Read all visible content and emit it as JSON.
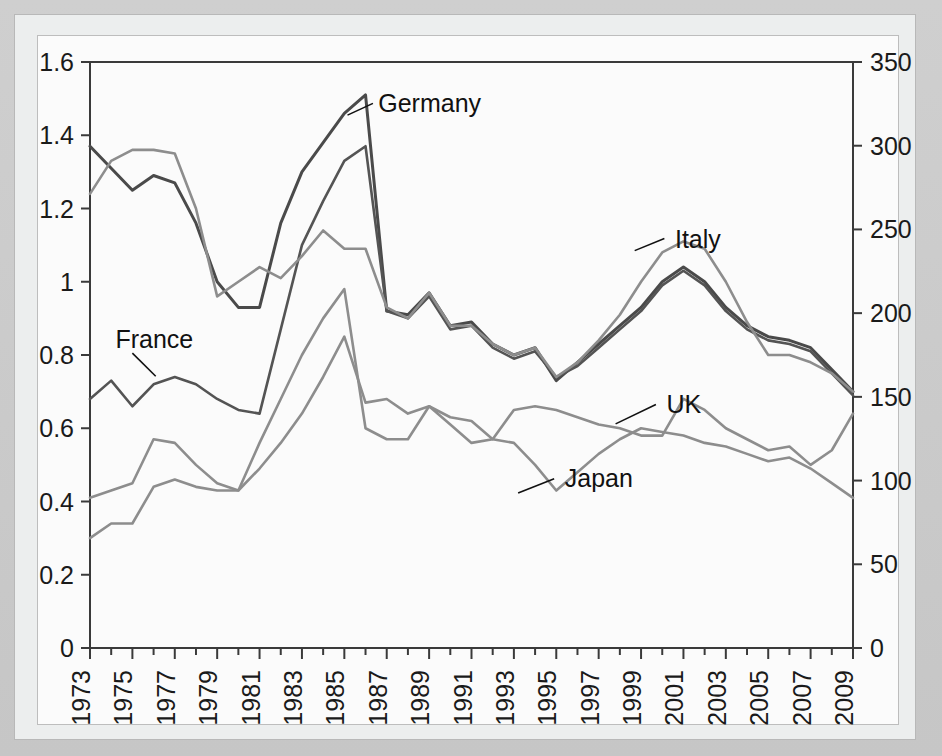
{
  "chart_data": {
    "type": "line",
    "title": "",
    "subtitle": "",
    "xlabel": "",
    "ylabel": "",
    "y2label": "",
    "grid": false,
    "legend_position": "inline-annotations",
    "xlim": [
      1973,
      2009
    ],
    "ylim": [
      0,
      1.6
    ],
    "y2lim": [
      0,
      350
    ],
    "y_ticks": [
      "0",
      "0.2",
      "0.4",
      "0.6",
      "0.8",
      "1",
      "1.2",
      "1.4",
      "1.6"
    ],
    "y_tick_values": [
      0,
      0.2,
      0.4,
      0.6,
      0.8,
      1,
      1.2,
      1.4,
      1.6
    ],
    "y2_ticks": [
      "0",
      "50",
      "100",
      "150",
      "200",
      "250",
      "300",
      "350"
    ],
    "y2_tick_values": [
      0,
      50,
      100,
      150,
      200,
      250,
      300,
      350
    ],
    "x": [
      1973,
      1974,
      1975,
      1976,
      1977,
      1978,
      1979,
      1980,
      1981,
      1982,
      1983,
      1984,
      1985,
      1986,
      1987,
      1988,
      1989,
      1990,
      1991,
      1992,
      1993,
      1994,
      1995,
      1996,
      1997,
      1998,
      1999,
      2000,
      2001,
      2002,
      2003,
      2004,
      2005,
      2006,
      2007,
      2008,
      2009
    ],
    "x_tick_labels": [
      "1973",
      "1975",
      "1977",
      "1979",
      "1981",
      "1983",
      "1985",
      "1987",
      "1989",
      "1991",
      "1993",
      "1995",
      "1997",
      "1999",
      "2001",
      "2003",
      "2005",
      "2007",
      "2009"
    ],
    "x_tick_values": [
      1973,
      1975,
      1977,
      1979,
      1981,
      1983,
      1985,
      1987,
      1989,
      1991,
      1993,
      1995,
      1997,
      1999,
      2001,
      2003,
      2005,
      2007,
      2009
    ],
    "series": [
      {
        "name": "Germany",
        "color": "#4a4a4a",
        "width": 3.0,
        "label_x": 1986.6,
        "label_y": 1.487,
        "leader": [
          [
            1985.15,
            1.455
          ],
          [
            1986.35,
            1.487
          ]
        ],
        "values": [
          1.37,
          1.31,
          1.25,
          1.29,
          1.27,
          1.16,
          1.0,
          0.93,
          0.93,
          1.16,
          1.3,
          1.38,
          1.46,
          1.51,
          0.92,
          0.91,
          0.97,
          0.88,
          0.89,
          0.83,
          0.8,
          0.82,
          0.73,
          0.78,
          0.83,
          0.88,
          0.93,
          1.0,
          1.04,
          1.0,
          0.93,
          0.88,
          0.85,
          0.84,
          0.82,
          0.76,
          0.7
        ]
      },
      {
        "name": "France",
        "color": "#545454",
        "width": 2.6,
        "label_x": 1974.2,
        "label_y": 0.845,
        "leader": [
          [
            1976.1,
            0.742
          ],
          [
            1975.0,
            0.805
          ]
        ],
        "values": [
          0.68,
          0.73,
          0.66,
          0.72,
          0.74,
          0.72,
          0.68,
          0.65,
          0.64,
          0.87,
          1.1,
          1.22,
          1.33,
          1.37,
          0.92,
          0.9,
          0.96,
          0.87,
          0.88,
          0.82,
          0.79,
          0.81,
          0.74,
          0.77,
          0.82,
          0.87,
          0.92,
          0.99,
          1.03,
          0.99,
          0.92,
          0.87,
          0.84,
          0.83,
          0.81,
          0.75,
          0.69
        ]
      },
      {
        "name": "Italy",
        "color": "#8d8d8d",
        "width": 2.6,
        "label_x": 2000.6,
        "label_y": 1.118,
        "leader": [
          [
            1998.7,
            1.085
          ],
          [
            2000.1,
            1.118
          ]
        ],
        "values": [
          1.24,
          1.33,
          1.36,
          1.36,
          1.35,
          1.2,
          0.96,
          1.0,
          1.04,
          1.01,
          1.07,
          1.14,
          1.09,
          1.09,
          0.93,
          0.9,
          0.97,
          0.88,
          0.88,
          0.83,
          0.8,
          0.82,
          0.74,
          0.78,
          0.84,
          0.91,
          1.0,
          1.08,
          1.11,
          1.09,
          1.0,
          0.89,
          0.8,
          0.8,
          0.78,
          0.75,
          0.7
        ]
      },
      {
        "name": "UK",
        "color": "#8d8d8d",
        "width": 2.6,
        "label_x": 2000.2,
        "label_y": 0.665,
        "leader": [
          [
            1997.8,
            0.612
          ],
          [
            1999.7,
            0.665
          ]
        ],
        "values": [
          0.41,
          0.43,
          0.45,
          0.57,
          0.56,
          0.5,
          0.45,
          0.43,
          0.49,
          0.56,
          0.64,
          0.74,
          0.85,
          0.67,
          0.68,
          0.64,
          0.66,
          0.61,
          0.56,
          0.57,
          0.65,
          0.66,
          0.65,
          0.63,
          0.61,
          0.6,
          0.58,
          0.58,
          0.68,
          0.65,
          0.6,
          0.57,
          0.54,
          0.55,
          0.5,
          0.54,
          0.64
        ]
      },
      {
        "name": "Japan",
        "color": "#8d8d8d",
        "width": 2.6,
        "label_x": 1995.4,
        "label_y": 0.465,
        "leader": [
          [
            1993.2,
            0.423
          ],
          [
            1994.9,
            0.462
          ]
        ],
        "values": [
          0.3,
          0.34,
          0.34,
          0.44,
          0.46,
          0.44,
          0.43,
          0.43,
          0.56,
          0.68,
          0.8,
          0.9,
          0.98,
          0.6,
          0.57,
          0.57,
          0.66,
          0.63,
          0.62,
          0.57,
          0.56,
          0.5,
          0.43,
          0.48,
          0.53,
          0.57,
          0.6,
          0.59,
          0.58,
          0.56,
          0.55,
          0.53,
          0.51,
          0.52,
          0.49,
          0.45,
          0.41
        ]
      }
    ]
  },
  "labels": {
    "germany": "Germany",
    "france": "France",
    "italy": "Italy",
    "uk": "UK",
    "japan": "Japan"
  },
  "colors": {
    "axis": "#3a3a3a",
    "dark_series": "#4a4a4a",
    "mid_series": "#545454",
    "light_series": "#8d8d8d",
    "plot_background": "#fbfbfb",
    "card_background": "#eceeee",
    "mat_background": "#c9c9c9"
  }
}
